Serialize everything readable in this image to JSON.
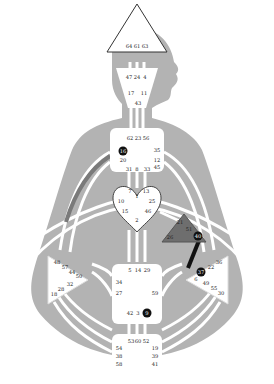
{
  "colors": {
    "background": "#ffffff",
    "body": "#b3b3b3",
    "channel": "#ffffff",
    "center_fill": "#ffffff",
    "center_defined": "#6e6e6e",
    "active_gate": "#111111",
    "channel_active_dark": "#111111",
    "channel_active_gray": "#7a7a7a"
  },
  "centers": {
    "head": {
      "name": "Head",
      "gates": [
        "64",
        "61",
        "63"
      ]
    },
    "ajna": {
      "name": "Ajna",
      "gates": [
        "47",
        "24",
        "4",
        "17",
        "11",
        "43"
      ]
    },
    "throat": {
      "name": "Throat",
      "gates": [
        "62",
        "23",
        "56",
        "16",
        "35",
        "20",
        "12",
        "45",
        "31",
        "8",
        "33"
      ],
      "active": [
        "16"
      ]
    },
    "g": {
      "name": "G",
      "gates": [
        "7",
        "1",
        "13",
        "10",
        "25",
        "15",
        "46",
        "2"
      ]
    },
    "ego": {
      "name": "Ego",
      "gates": [
        "21",
        "51",
        "26",
        "40"
      ],
      "active": [
        "40"
      ],
      "defined": true
    },
    "spleen": {
      "name": "Spleen",
      "gates": [
        "48",
        "57",
        "44",
        "50",
        "32",
        "28",
        "18"
      ]
    },
    "solar_plexus": {
      "name": "Solar Plexus",
      "gates": [
        "36",
        "22",
        "37",
        "6",
        "49",
        "55",
        "30"
      ],
      "active": [
        "37"
      ]
    },
    "sacral": {
      "name": "Sacral",
      "gates": [
        "5",
        "14",
        "29",
        "34",
        "27",
        "59",
        "42",
        "3",
        "9"
      ],
      "active": [
        "9"
      ]
    },
    "root": {
      "name": "Root",
      "gates": [
        "53",
        "60",
        "52",
        "54",
        "19",
        "38",
        "39",
        "58",
        "41"
      ]
    }
  },
  "active_channels": [
    {
      "from": "37",
      "to": "40",
      "style": "black"
    },
    {
      "from": "16",
      "to": "48",
      "style": "gray-partial"
    }
  ],
  "g": {
    "head": [
      "64",
      "61",
      "63"
    ],
    "ajna": [
      "47",
      "24",
      "4",
      "17",
      "11",
      "43"
    ],
    "throat": [
      "62",
      "23",
      "56",
      "16",
      "35",
      "20",
      "12",
      "45",
      "31",
      "8",
      "33"
    ],
    "gc": [
      "7",
      "1",
      "13",
      "10",
      "25",
      "15",
      "46",
      "2"
    ],
    "ego": [
      "21",
      "51",
      "26",
      "40"
    ],
    "spleen": [
      "48",
      "57",
      "44",
      "50",
      "32",
      "28",
      "18"
    ],
    "sp": [
      "36",
      "22",
      "37",
      "6",
      "49",
      "55",
      "30"
    ],
    "sacral": [
      "5",
      "14",
      "29",
      "34",
      "27",
      "59",
      "42",
      "3",
      "9"
    ],
    "root": [
      "53",
      "60",
      "52",
      "54",
      "19",
      "38",
      "39",
      "58",
      "41"
    ]
  }
}
